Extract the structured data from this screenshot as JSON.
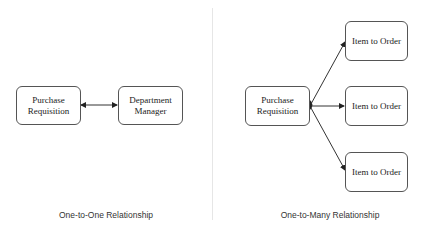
{
  "left": {
    "source": "Purchase Requisition",
    "target": "Department Manager",
    "caption": "One-to-One Relationship"
  },
  "right": {
    "source": "Purchase Requisition",
    "targets": [
      "Item to Order",
      "Item to Order",
      "Item to Order"
    ],
    "caption": "One-to-Many Relationship"
  }
}
